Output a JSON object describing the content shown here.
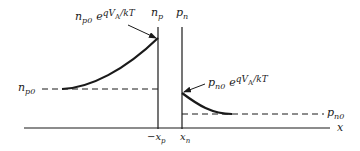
{
  "diagram": {
    "colors": {
      "line": "#1a1a1a",
      "background": "#ffffff"
    },
    "axis": {
      "label": "x"
    },
    "boundaries": {
      "left": {
        "top_label": "n",
        "top_sub": "p",
        "bottom_label": "−x",
        "bottom_sub": "p"
      },
      "right": {
        "top_label": "p",
        "top_sub": "n",
        "bottom_label": "x",
        "bottom_sub": "n"
      }
    },
    "levels": {
      "np0": {
        "base": "n",
        "sub": "p0"
      },
      "pn0": {
        "base": "p",
        "sub": "n0"
      }
    },
    "annotations": {
      "np_edge": {
        "base": "n",
        "sub": "p0",
        "exp_e": "e",
        "exp_text": "qV",
        "exp_sub": "A",
        "exp_tail": "/kT"
      },
      "pn_edge": {
        "base": "p",
        "sub": "n0",
        "exp_e": "e",
        "exp_text": "qV",
        "exp_sub": "A",
        "exp_tail": "/kT"
      }
    }
  }
}
